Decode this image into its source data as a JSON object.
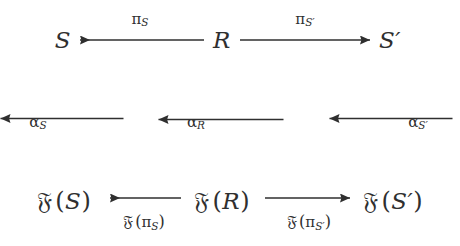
{
  "diagram": {
    "ink_color": "#2f2f2f",
    "background_color": "#ffffff",
    "nodes": {
      "top_left": {
        "label": "S",
        "x": 63,
        "y": 40
      },
      "top_middle": {
        "label": "R",
        "x": 222,
        "y": 40
      },
      "top_right": {
        "label": "S′",
        "x": 390,
        "y": 40
      },
      "bottom_left": {
        "functor": "𝔉",
        "open": "(",
        "argument": "S",
        "close": ")",
        "x": 64,
        "y": 201
      },
      "bottom_middle": {
        "functor": "𝔉",
        "open": "(",
        "argument": "R",
        "close": ")",
        "x": 222,
        "y": 201
      },
      "bottom_right": {
        "functor": "𝔉",
        "open": "(",
        "argument": "S′",
        "close": ")",
        "x": 393,
        "y": 201
      }
    },
    "arrows": {
      "top_left_arrow": {
        "name": "pi-S-arrow",
        "direction": "left",
        "from": "R",
        "to": "S",
        "label_greek": "π",
        "label_sub": "S",
        "label_x": 140,
        "label_y": 19
      },
      "top_right_arrow": {
        "name": "pi-S-prime-arrow",
        "direction": "right",
        "from": "R",
        "to": "S′",
        "label_greek": "π",
        "label_sub": "S′",
        "label_x": 305,
        "label_y": 19
      },
      "left_vertical_arrow": {
        "name": "alpha-S-arrow",
        "direction": "down",
        "from": "S",
        "to": "𝔉(S)",
        "label_greek": "α",
        "label_sub": "S",
        "label_x": 38,
        "label_y": 122
      },
      "middle_vertical_arrow": {
        "name": "alpha-R-arrow",
        "direction": "down",
        "from": "R",
        "to": "𝔉(R)",
        "label_greek": "α",
        "label_sub": "R",
        "label_x": 196,
        "label_y": 122
      },
      "right_vertical_arrow": {
        "name": "alpha-S-prime-arrow",
        "direction": "down",
        "from": "S′",
        "to": "𝔉(S′)",
        "label_greek": "α",
        "label_sub": "S′",
        "label_x": 418,
        "label_y": 122
      },
      "bottom_left_arrow": {
        "name": "functor-pi-S-arrow",
        "direction": "left",
        "from": "𝔉(R)",
        "to": "𝔉(S)",
        "label_functor": "𝔉",
        "label_open": "(",
        "label_greek": "π",
        "label_sub": "S",
        "label_close": ")",
        "label_x": 144,
        "label_y": 222
      },
      "bottom_right_arrow": {
        "name": "functor-pi-S-prime-arrow",
        "direction": "right",
        "from": "𝔉(R)",
        "to": "𝔉(S′)",
        "label_functor": "𝔉",
        "label_open": "(",
        "label_greek": "π",
        "label_sub": "S′",
        "label_close": ")",
        "label_x": 309,
        "label_y": 222
      }
    }
  }
}
